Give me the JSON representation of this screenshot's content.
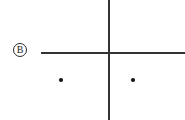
{
  "diagram": {
    "title": "",
    "background_color": "#ffffff",
    "stroke_color": "#333333",
    "label": {
      "text": "B",
      "style": "circled",
      "x": 20,
      "y": 50
    },
    "axes": [
      {
        "name": "horizontal-axis",
        "orientation": "horizontal",
        "x1": 41,
        "y1": 53,
        "x2": 185,
        "y2": 53,
        "color": "#333333"
      },
      {
        "name": "vertical-axis",
        "orientation": "vertical",
        "x1": 109,
        "y1": 0,
        "x2": 109,
        "y2": 120,
        "color": "#333333"
      }
    ],
    "points": [
      {
        "name": "dot-left",
        "x": 61,
        "y": 80,
        "radius": 2,
        "color": "#111111"
      },
      {
        "name": "dot-right",
        "x": 133,
        "y": 80,
        "radius": 2,
        "color": "#111111"
      }
    ]
  }
}
